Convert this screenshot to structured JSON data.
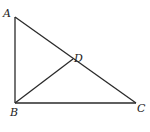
{
  "diagram": {
    "type": "geometry",
    "points": {
      "A": {
        "label": "A",
        "x": 15,
        "y": 17,
        "lx": 3,
        "ly": 17
      },
      "B": {
        "label": "B",
        "x": 15,
        "y": 103,
        "lx": 10,
        "ly": 116
      },
      "C": {
        "label": "C",
        "x": 136,
        "y": 103,
        "lx": 137,
        "ly": 112
      },
      "D": {
        "label": "D",
        "x": 73,
        "y": 59,
        "lx": 74,
        "ly": 62
      }
    },
    "segments": [
      {
        "name": "AB",
        "from": "A",
        "to": "B"
      },
      {
        "name": "BC",
        "from": "B",
        "to": "C"
      },
      {
        "name": "AC",
        "from": "A",
        "to": "C"
      },
      {
        "name": "BD",
        "from": "B",
        "to": "D"
      }
    ]
  }
}
